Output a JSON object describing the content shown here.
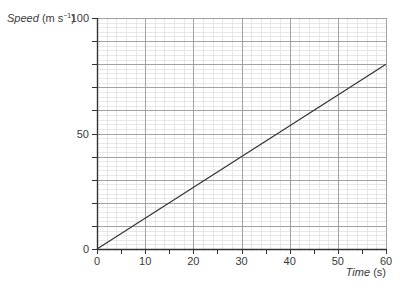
{
  "chart_data": {
    "type": "line",
    "title": "",
    "xlabel": "Time (s)",
    "xlabel_italic": "Time",
    "xlabel_unit": "(s)",
    "ylabel": "Speed (m s⁻¹)",
    "ylabel_italic": "Speed",
    "ylabel_unit_prefix": "(m s",
    "ylabel_unit_sup": "−1",
    "ylabel_unit_suffix": ")",
    "xlim": [
      0,
      60
    ],
    "ylim": [
      0,
      100
    ],
    "x_ticks": [
      0,
      10,
      20,
      30,
      40,
      50,
      60
    ],
    "x_tick_labels": [
      "0",
      "10",
      "20",
      "30",
      "40",
      "50",
      "60"
    ],
    "y_tick_labels_shown": [
      "0",
      "50",
      "100"
    ],
    "y_ticks": [
      0,
      50,
      100
    ],
    "grid": true,
    "grid_major_x": 10,
    "grid_major_y": 10,
    "grid_minor_x": 2,
    "grid_minor_y": 2,
    "legend": null,
    "series": [
      {
        "name": "speed",
        "x": [
          0,
          60
        ],
        "y": [
          0,
          80
        ],
        "color": "#333333"
      }
    ]
  },
  "colors": {
    "axis": "#333333",
    "grid_major": "#9a9a9a",
    "grid_minor": "#d9d9d9",
    "line": "#333333"
  }
}
